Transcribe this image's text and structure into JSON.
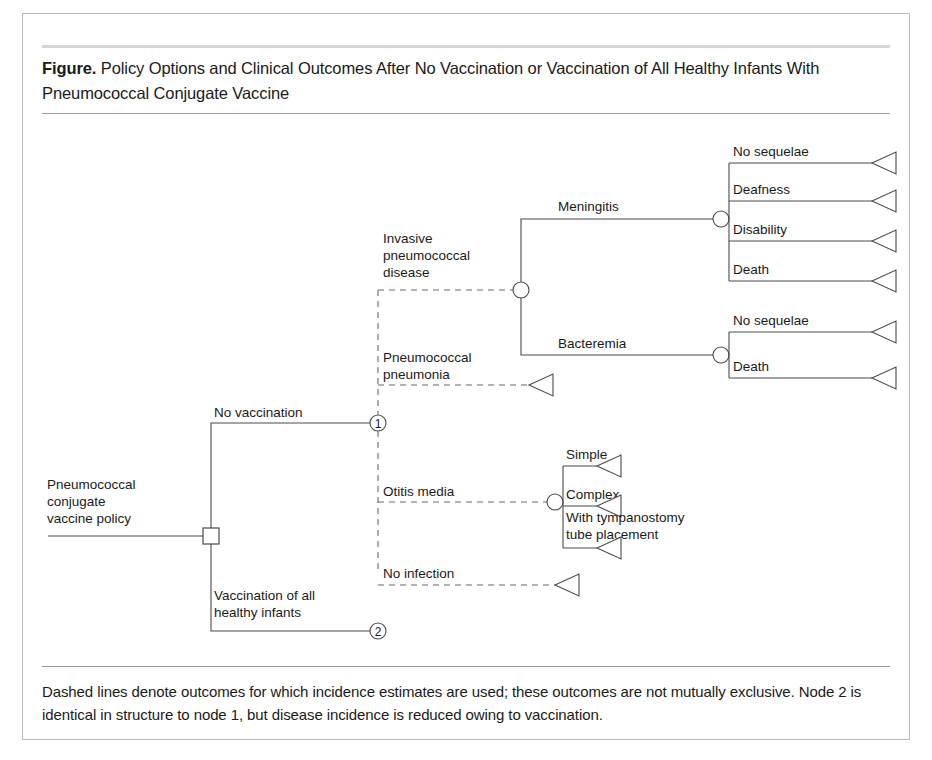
{
  "figure": {
    "label_prefix": "Figure.",
    "title": "Policy Options and Clinical Outcomes After No Vaccination or Vaccination of All Healthy Infants With Pneumococcal Conjugate Vaccine",
    "footnote": "Dashed lines denote outcomes for which incidence estimates are used; these outcomes are not mutually exclusive. Node 2 is identical in structure to node 1, but disease incidence is reduced owing to vaccination.",
    "frame_border_color": "#b9b9b9",
    "rule_color": "#9a9a9a",
    "line_color": "#4a4a4a",
    "dashed_line_color": "#6a6a6a",
    "background_color": "#ffffff"
  },
  "tree": {
    "type": "decision-tree",
    "root": {
      "label_line1": "Pneumococcal",
      "label_line2": "conjugate",
      "label_line3": "vaccine policy",
      "node_shape": "square",
      "node_kind": "decision"
    },
    "policy_branches": [
      {
        "label": "No vaccination",
        "node_number": "1"
      },
      {
        "label_line1": "Vaccination of all",
        "label_line2": "healthy infants",
        "node_number": "2"
      }
    ],
    "node1_outcomes": [
      {
        "label_line1": "Invasive",
        "label_line2": "pneumococcal",
        "label_line3": "disease",
        "line_style": "dashed",
        "node_shape": "circle",
        "node_kind": "chance",
        "children": [
          {
            "label": "Meningitis",
            "line_style": "solid",
            "node_shape": "circle",
            "node_kind": "chance",
            "children": [
              {
                "label": "No sequelae",
                "line_style": "solid",
                "terminal": true
              },
              {
                "label": "Deafness",
                "line_style": "solid",
                "terminal": true
              },
              {
                "label": "Disability",
                "line_style": "solid",
                "terminal": true
              },
              {
                "label": "Death",
                "line_style": "solid",
                "terminal": true
              }
            ]
          },
          {
            "label": "Bacteremia",
            "line_style": "solid",
            "node_shape": "circle",
            "node_kind": "chance",
            "children": [
              {
                "label": "No sequelae",
                "line_style": "solid",
                "terminal": true
              },
              {
                "label": "Death",
                "line_style": "solid",
                "terminal": true
              }
            ]
          }
        ]
      },
      {
        "label_line1": "Pneumococcal",
        "label_line2": "pneumonia",
        "line_style": "dashed",
        "terminal": true
      },
      {
        "label": "Otitis media",
        "line_style": "dashed",
        "node_shape": "circle",
        "node_kind": "chance",
        "children": [
          {
            "label": "Simple",
            "line_style": "solid",
            "terminal": true
          },
          {
            "label": "Complex",
            "line_style": "solid",
            "terminal": true
          },
          {
            "label_line1": "With tympanostomy",
            "label_line2": "tube placement",
            "line_style": "solid",
            "terminal": true
          }
        ]
      },
      {
        "label": "No infection",
        "line_style": "dashed",
        "terminal": true
      }
    ]
  },
  "labels": {
    "root_l1": "Pneumococcal",
    "root_l2": "conjugate",
    "root_l3": "vaccine policy",
    "no_vaccination": "No vaccination",
    "vacc_all_l1": "Vaccination of all",
    "vacc_all_l2": "healthy infants",
    "node1_num": "1",
    "node2_num": "2",
    "ipd_l1": "Invasive",
    "ipd_l2": "pneumococcal",
    "ipd_l3": "disease",
    "pneumonia_l1": "Pneumococcal",
    "pneumonia_l2": "pneumonia",
    "otitis": "Otitis media",
    "no_infection": "No infection",
    "meningitis": "Meningitis",
    "bacteremia": "Bacteremia",
    "men_no_sequelae": "No sequelae",
    "men_deafness": "Deafness",
    "men_disability": "Disability",
    "men_death": "Death",
    "bac_no_sequelae": "No sequelae",
    "bac_death": "Death",
    "otitis_simple": "Simple",
    "otitis_complex": "Complex",
    "otitis_tube_l1": "With tympanostomy",
    "otitis_tube_l2": "tube placement"
  }
}
